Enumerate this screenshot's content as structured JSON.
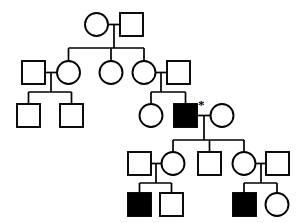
{
  "figure": {
    "kind": "pedigree-chart",
    "title": "",
    "caption": "",
    "background_color": "#ffffff",
    "line_color": "#000000",
    "affected_fill_color": "#000000",
    "unaffected_fill_color": "#ffffff"
  },
  "legend": {
    "square_meaning": "male",
    "circle_meaning": "female",
    "filled_meaning": "affected",
    "open_meaning": "unaffected",
    "asterisk_meaning": "proband"
  },
  "annotations": [
    {
      "id": "proband-marker",
      "symbol": "*",
      "x": 198,
      "y": 99,
      "attached_to": "III-3"
    }
  ],
  "generations": [
    {
      "id": "I",
      "label": "I",
      "y": 13,
      "individuals": [
        {
          "id": "I-1",
          "shape": "circle",
          "sex": "female",
          "status": "unaffected",
          "cx": 96.5,
          "cy": 24.5,
          "r": 11.5
        },
        {
          "id": "I-2",
          "shape": "square",
          "sex": "male",
          "status": "unaffected",
          "x": 120,
          "y": 13,
          "size": 23
        }
      ]
    },
    {
      "id": "II",
      "label": "II",
      "y": 61,
      "individuals": [
        {
          "id": "II-1",
          "shape": "square",
          "sex": "male",
          "status": "unaffected",
          "x": 22,
          "y": 61,
          "size": 23
        },
        {
          "id": "II-2",
          "shape": "circle",
          "sex": "female",
          "status": "unaffected",
          "cx": 68.5,
          "cy": 72.5,
          "r": 11.5
        },
        {
          "id": "II-3",
          "shape": "circle",
          "sex": "female",
          "status": "unaffected",
          "cx": 111,
          "cy": 72.5,
          "r": 11.5
        },
        {
          "id": "II-4",
          "shape": "circle",
          "sex": "female",
          "status": "unaffected",
          "cx": 144,
          "cy": 72.5,
          "r": 11.5
        },
        {
          "id": "II-5",
          "shape": "square",
          "sex": "male",
          "status": "unaffected",
          "x": 167,
          "y": 61,
          "size": 23
        }
      ]
    },
    {
      "id": "III",
      "label": "III",
      "y": 104,
      "individuals": [
        {
          "id": "III-1",
          "shape": "square",
          "sex": "male",
          "status": "unaffected",
          "x": 17,
          "y": 104,
          "size": 23
        },
        {
          "id": "III-2",
          "shape": "square",
          "sex": "male",
          "status": "unaffected",
          "x": 60,
          "y": 104,
          "size": 23
        },
        {
          "id": "III-2b",
          "shape": "circle",
          "sex": "female",
          "status": "unaffected",
          "cx": 151,
          "cy": 115.5,
          "r": 11.5
        },
        {
          "id": "III-3",
          "shape": "square",
          "sex": "male",
          "status": "affected",
          "x": 174,
          "y": 104,
          "size": 23,
          "proband": true
        },
        {
          "id": "III-4",
          "shape": "circle",
          "sex": "female",
          "status": "unaffected",
          "cx": 222,
          "cy": 115.5,
          "r": 11.5
        }
      ]
    },
    {
      "id": "IV",
      "label": "IV",
      "y": 152,
      "individuals": [
        {
          "id": "IV-1",
          "shape": "square",
          "sex": "male",
          "status": "unaffected",
          "x": 128,
          "y": 152,
          "size": 23
        },
        {
          "id": "IV-2",
          "shape": "circle",
          "sex": "female",
          "status": "unaffected",
          "cx": 173,
          "cy": 163.5,
          "r": 11.5
        },
        {
          "id": "IV-3",
          "shape": "square",
          "sex": "male",
          "status": "unaffected",
          "x": 198,
          "y": 152,
          "size": 23
        },
        {
          "id": "IV-4",
          "shape": "circle",
          "sex": "female",
          "status": "unaffected",
          "cx": 244,
          "cy": 163.5,
          "r": 11.5
        },
        {
          "id": "IV-5",
          "shape": "square",
          "sex": "male",
          "status": "unaffected",
          "x": 266,
          "y": 152,
          "size": 23
        }
      ]
    },
    {
      "id": "V",
      "label": "V",
      "y": 193,
      "individuals": [
        {
          "id": "V-1",
          "shape": "square",
          "sex": "male",
          "status": "affected",
          "x": 128,
          "y": 193,
          "size": 23
        },
        {
          "id": "V-2",
          "shape": "square",
          "sex": "male",
          "status": "unaffected",
          "x": 160,
          "y": 193,
          "size": 23
        },
        {
          "id": "V-3",
          "shape": "square",
          "sex": "male",
          "status": "affected",
          "x": 233,
          "y": 193,
          "size": 23
        },
        {
          "id": "V-4",
          "shape": "circle",
          "sex": "female",
          "status": "unaffected",
          "cx": 277,
          "cy": 204.5,
          "r": 11.5
        }
      ]
    }
  ],
  "connections": {
    "mating_lines": [
      {
        "id": "mate-I",
        "x1": 108,
        "y1": 24.5,
        "x2": 120,
        "y2": 24.5
      },
      {
        "id": "mate-II-1-2",
        "x1": 45,
        "y1": 72.5,
        "x2": 57,
        "y2": 72.5
      },
      {
        "id": "mate-II-4-5",
        "x1": 155.5,
        "y1": 72.5,
        "x2": 167,
        "y2": 72.5
      },
      {
        "id": "mate-III-3-4",
        "x1": 197,
        "y1": 115.5,
        "x2": 210.5,
        "y2": 115.5
      },
      {
        "id": "mate-IV-1-2",
        "x1": 151,
        "y1": 163.5,
        "x2": 161.5,
        "y2": 163.5
      },
      {
        "id": "mate-IV-4-5",
        "x1": 255.5,
        "y1": 163.5,
        "x2": 266,
        "y2": 163.5
      }
    ],
    "descent_lines": [
      {
        "id": "descent-I",
        "from": "I couple",
        "drop_x": 114,
        "drop_y1": 24.5,
        "drop_y2": 48,
        "sib_x1": 68.5,
        "sib_x2": 144,
        "sib_y": 48
      },
      {
        "id": "descent-II-1-2",
        "from": "II-1 x II-2",
        "drop_x": 51,
        "drop_y1": 72.5,
        "drop_y2": 92,
        "sib_x1": 28.5,
        "sib_x2": 71.5,
        "sib_y": 92
      },
      {
        "id": "descent-II-4-5",
        "from": "II-4 x II-5",
        "drop_x": 161,
        "drop_y1": 72.5,
        "drop_y2": 92,
        "sib_x1": 151,
        "sib_x2": 185.5,
        "sib_y": 92
      },
      {
        "id": "descent-III-3-4",
        "from": "III-3 x III-4",
        "drop_x": 204,
        "drop_y1": 115.5,
        "drop_y2": 140,
        "sib_x1": 173,
        "sib_x2": 244,
        "sib_y": 140
      },
      {
        "id": "descent-IV-1-2",
        "from": "IV-1 x IV-2",
        "drop_x": 156,
        "drop_y1": 163.5,
        "drop_y2": 183,
        "sib_x1": 139.5,
        "sib_x2": 171.5,
        "sib_y": 183
      },
      {
        "id": "descent-IV-4-5",
        "from": "IV-4 x IV-5",
        "drop_x": 261,
        "drop_y1": 163.5,
        "drop_y2": 183,
        "sib_x1": 244,
        "sib_x2": 277,
        "sib_y": 183
      }
    ]
  },
  "counts": {
    "total_individuals": 21,
    "affected_individuals": 3,
    "males": 12,
    "females": 9,
    "generations": 5
  }
}
